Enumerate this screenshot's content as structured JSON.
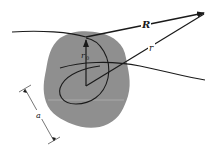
{
  "diagram": {
    "labels": {
      "R": "R",
      "r": "r",
      "r0": "r",
      "r0_sub": "0",
      "a": "a"
    },
    "colors": {
      "blob": "#8f8f8f",
      "line": "#1a1a1a",
      "background": "#ffffff"
    }
  }
}
